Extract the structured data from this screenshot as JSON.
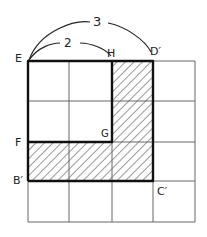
{
  "diagram": {
    "grid": {
      "cols": 4,
      "rows": 4,
      "x": [
        28,
        69,
        112,
        153,
        195
      ],
      "y": [
        61,
        101,
        142,
        181,
        222
      ]
    },
    "labels": {
      "E": "E",
      "H": "H",
      "D_prime": "D′",
      "F": "F",
      "G": "G",
      "B_prime": "B′",
      "C_prime": "C′",
      "arc_outer": "3",
      "arc_inner": "2"
    },
    "shaded_region": "L-shape: column H–D′ from top to bottom, plus row F–G to C′",
    "colors": {
      "line": "#222222",
      "grid": "#666666",
      "hatch": "#333333",
      "background": "#ffffff"
    }
  }
}
